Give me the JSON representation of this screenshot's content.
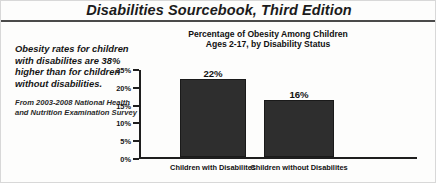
{
  "header": {
    "book_title": "Disabilities Sourcebook, Third Edition"
  },
  "caption": {
    "pull_quote": "Obesity rates for children with disabilites are 38% higher than for children without disabilities.",
    "source_note": "From 2003-2008 National Health and Nutrition Examination Survey"
  },
  "chart_data": {
    "type": "bar",
    "title": "Percentage of Obesity Among Children Ages 2-17, by Disability Status",
    "title_line1": "Percentage of Obesity Among Children",
    "title_line2": "Ages 2-17, by Disability Status",
    "categories": [
      "Children with Disabilites",
      "Children without Disabilites"
    ],
    "values": [
      22,
      16
    ],
    "value_labels": [
      "22%",
      "16%"
    ],
    "xlabel": "",
    "ylabel": "",
    "ylim": [
      0,
      25
    ],
    "ytick_labels": [
      "25%",
      "20%",
      "15%",
      "10%",
      "5%",
      "0%"
    ],
    "ytick_values": [
      25,
      20,
      15,
      10,
      5,
      0
    ],
    "grid": false,
    "legend": false,
    "bar_color": "#2e2e2e",
    "axis_color": "#1e1e1e"
  }
}
